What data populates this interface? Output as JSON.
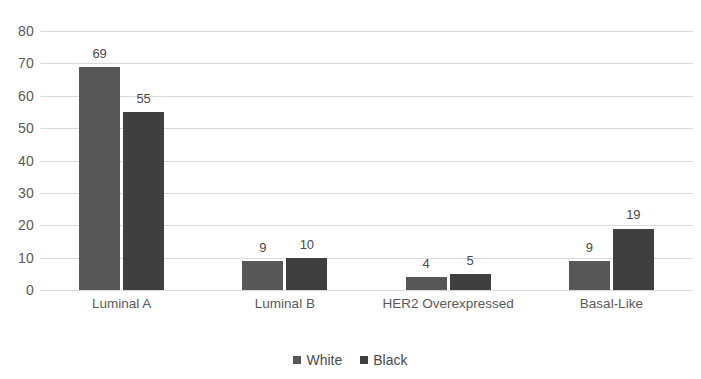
{
  "chart_data": {
    "type": "bar",
    "title": "",
    "subtitle": "",
    "xlabel": "",
    "ylabel": "",
    "categories": [
      "Luminal A",
      "Luminal B",
      "HER2 Overexpressed",
      "Basal-Like"
    ],
    "series": [
      {
        "name": "White",
        "values": [
          69,
          9,
          4,
          9
        ],
        "color": "#575757"
      },
      {
        "name": "Black",
        "values": [
          55,
          10,
          5,
          19
        ],
        "color": "#3f3f3f"
      }
    ],
    "ylim": [
      0,
      80
    ],
    "ytick_step": 10,
    "yticks": [
      "80",
      "70",
      "60",
      "50",
      "40",
      "30",
      "20",
      "10",
      "0"
    ],
    "grid": true,
    "grid_color": "#d9d9d9",
    "legend_position": "bottom",
    "data_labels": true,
    "background_color": "#ffffff"
  }
}
